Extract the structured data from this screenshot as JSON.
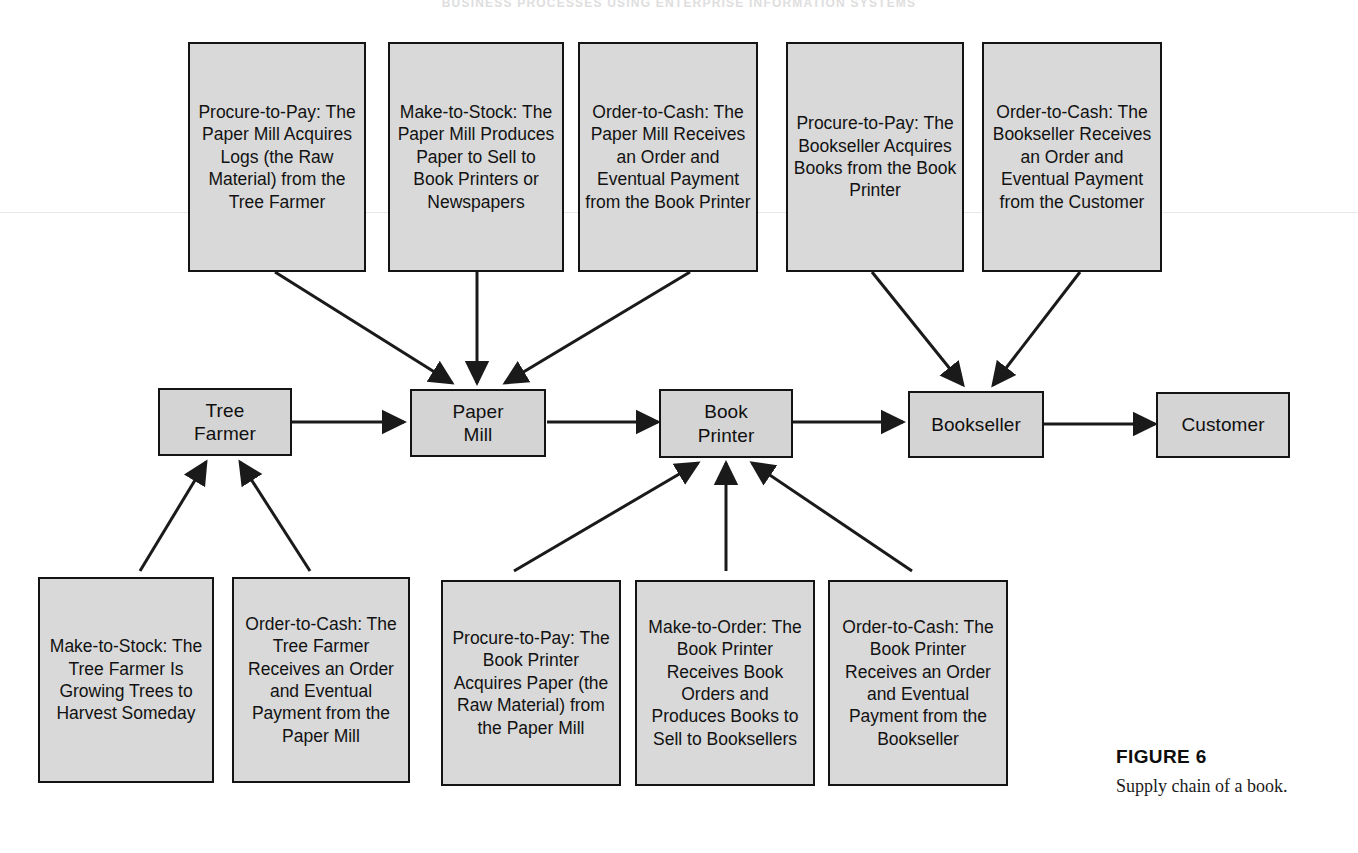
{
  "page": {
    "running_head": "BUSINESS PROCESSES USING ENTERPRISE INFORMATION SYSTEMS",
    "figure_label": "FIGURE 6",
    "figure_caption": "Supply chain of a book."
  },
  "diagram": {
    "title": "Supply chain of a book",
    "chain_nodes": [
      {
        "id": "tree-farmer",
        "label": "Tree\nFarmer"
      },
      {
        "id": "paper-mill",
        "label": "Paper\nMill"
      },
      {
        "id": "book-printer",
        "label": "Book\nPrinter"
      },
      {
        "id": "bookseller",
        "label": "Bookseller"
      },
      {
        "id": "customer",
        "label": "Customer"
      }
    ],
    "top_boxes": [
      {
        "id": "procure-to-pay-paper-mill",
        "process": "Procure-to-Pay",
        "text": "Procure-to-Pay: The Paper Mill Acquires Logs (the Raw Material) from the Tree Farmer",
        "target": "paper-mill"
      },
      {
        "id": "make-to-stock-paper-mill",
        "process": "Make-to-Stock",
        "text": "Make-to-Stock: The Paper Mill Produces Paper to Sell to Book Printers or Newspapers",
        "target": "paper-mill"
      },
      {
        "id": "order-to-cash-paper-mill",
        "process": "Order-to-Cash",
        "text": "Order-to-Cash: The Paper Mill Receives an Order and Eventual Payment from the Book Printer",
        "target": "paper-mill"
      },
      {
        "id": "procure-to-pay-bookseller",
        "process": "Procure-to-Pay",
        "text": "Procure-to-Pay: The Bookseller Acquires Books from the Book Printer",
        "target": "bookseller"
      },
      {
        "id": "order-to-cash-bookseller",
        "process": "Order-to-Cash",
        "text": "Order-to-Cash: The Bookseller Receives an Order and Eventual Payment from the Customer",
        "target": "bookseller"
      }
    ],
    "bottom_boxes": [
      {
        "id": "make-to-stock-tree-farmer",
        "process": "Make-to-Stock",
        "text": "Make-to-Stock: The Tree Farmer Is Growing Trees to Harvest Someday",
        "target": "tree-farmer"
      },
      {
        "id": "order-to-cash-tree-farmer",
        "process": "Order-to-Cash",
        "text": "Order-to-Cash: The Tree Farmer Receives an Order and Eventual Payment from the Paper Mill",
        "target": "tree-farmer"
      },
      {
        "id": "procure-to-pay-book-printer",
        "process": "Procure-to-Pay",
        "text": "Procure-to-Pay: The Book Printer Acquires Paper (the Raw Material) from the Paper Mill",
        "target": "book-printer"
      },
      {
        "id": "make-to-order-book-printer",
        "process": "Make-to-Order",
        "text": "Make-to-Order: The Book Printer Receives Book Orders and Produces Books to Sell to Booksellers",
        "target": "book-printer"
      },
      {
        "id": "order-to-cash-book-printer",
        "process": "Order-to-Cash",
        "text": "Order-to-Cash: The Book Printer Receives an Order and Eventual Payment from the Bookseller",
        "target": "book-printer"
      }
    ],
    "chain_flow": [
      {
        "from": "tree-farmer",
        "to": "paper-mill"
      },
      {
        "from": "paper-mill",
        "to": "book-printer"
      },
      {
        "from": "book-printer",
        "to": "bookseller"
      },
      {
        "from": "bookseller",
        "to": "customer"
      }
    ],
    "colors": {
      "box_fill": "#d9d9d9",
      "node_fill": "#d4d4d4",
      "border": "#141414",
      "arrow": "#1a1a1a"
    }
  }
}
